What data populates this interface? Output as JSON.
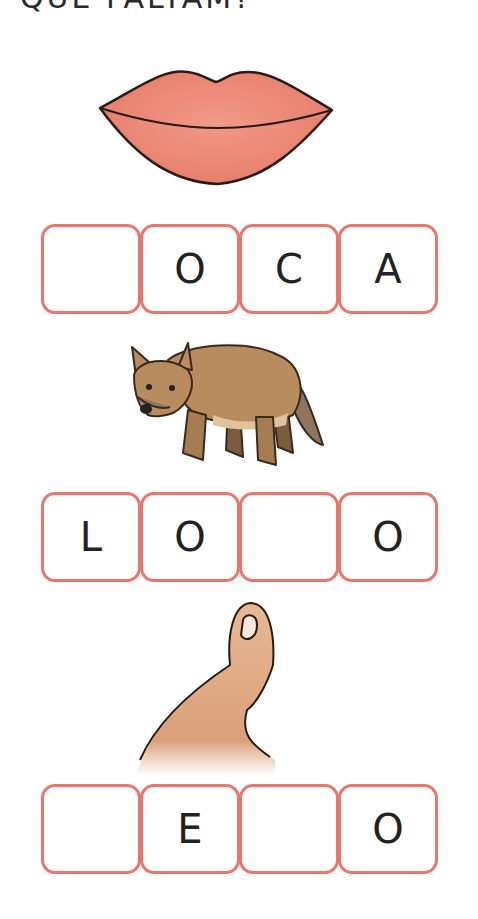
{
  "title": "QUE FALTAM?",
  "colors": {
    "box_border": "#e8766a",
    "letter": "#222222",
    "lips": "#ec8a76",
    "wolf": "#b88c5e",
    "thumb": "#e6b28e"
  },
  "exercises": [
    {
      "image": "lips-picture",
      "letters": [
        "",
        "O",
        "C",
        "A"
      ]
    },
    {
      "image": "wolf-picture",
      "letters": [
        "L",
        "O",
        "",
        "O"
      ]
    },
    {
      "image": "thumb-picture",
      "letters": [
        "",
        "E",
        "",
        "O"
      ]
    }
  ]
}
